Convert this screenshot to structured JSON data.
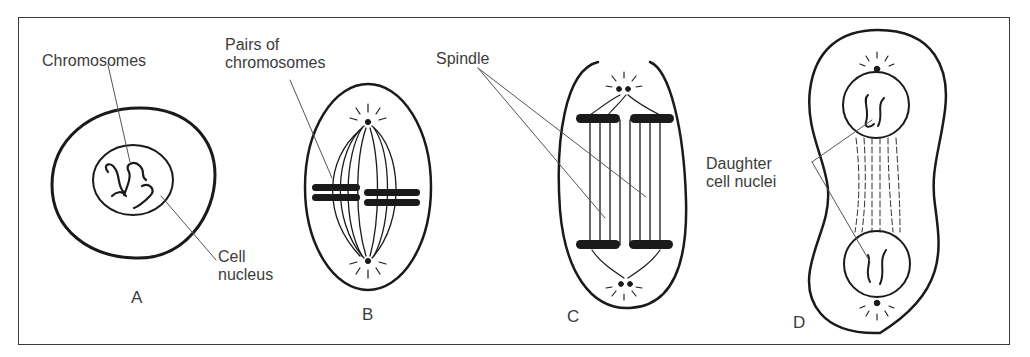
{
  "stages": [
    {
      "id": "A",
      "letter": "A",
      "labels": [
        "Chromosomes",
        "Cell\nnucleus"
      ]
    },
    {
      "id": "B",
      "letter": "B",
      "labels": [
        "Pairs of\nchromosomes"
      ]
    },
    {
      "id": "C",
      "letter": "C",
      "labels": [
        "Spindle"
      ]
    },
    {
      "id": "D",
      "letter": "D",
      "labels": [
        "Daughter\ncell nuclei"
      ]
    }
  ],
  "colors": {
    "ink": "#1a1a1a",
    "label": "#3c3c3c",
    "background": "#ffffff"
  }
}
